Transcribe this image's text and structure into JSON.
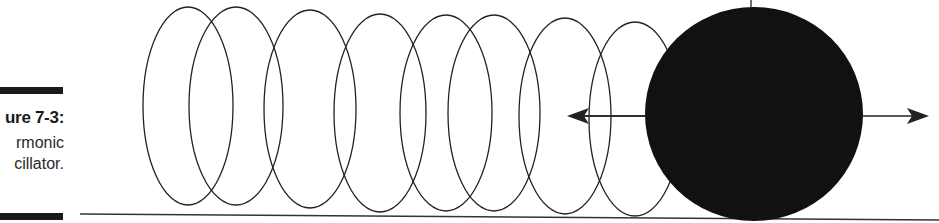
{
  "caption": {
    "figure_label": "ure 7-3:",
    "lines": [
      "rmonic",
      "cillator."
    ]
  },
  "diagram": {
    "spring_coils": 8,
    "colors": {
      "ink": "#1a1a1a",
      "ball": "#111111",
      "background": "#ffffff"
    },
    "arrow": "double-headed horizontal"
  }
}
